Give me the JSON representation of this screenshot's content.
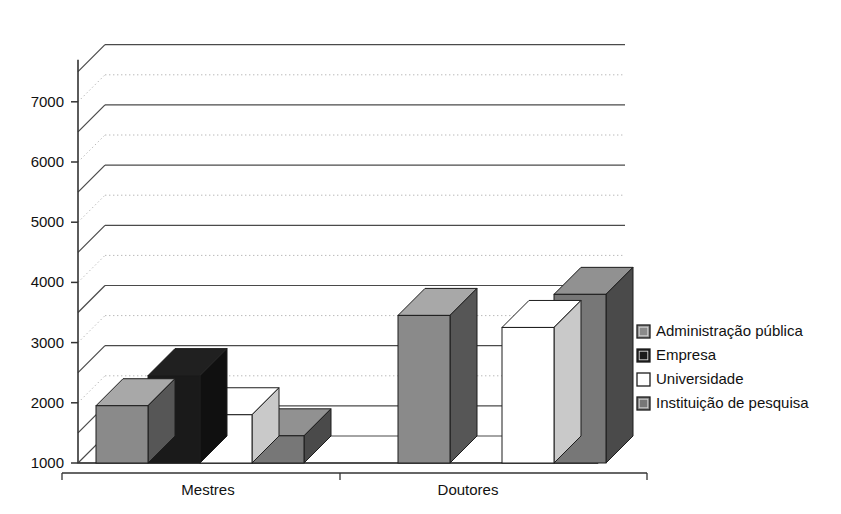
{
  "chart_data": {
    "type": "bar",
    "title": "",
    "subtitle": "",
    "xlabel": "",
    "ylabel": "",
    "categories": [
      "Mestres",
      "Doutores"
    ],
    "series": [
      {
        "name": "Administração pública",
        "color": "#8a8a8a",
        "values": [
          2400,
          3900
        ]
      },
      {
        "name": "Empresa",
        "color": "#1a1a1a",
        "values": [
          2900,
          null
        ]
      },
      {
        "name": "Universidade",
        "color": "#ffffff",
        "values": [
          2250,
          3700
        ]
      },
      {
        "name": "Instituição de pesquisa",
        "color": "#777777",
        "values": [
          1900,
          4250
        ]
      }
    ],
    "ylim": [
      1000,
      7500
    ],
    "ytick_labels": [
      "1000",
      "2000",
      "3000",
      "4000",
      "5000",
      "6000",
      "7000"
    ],
    "ytick_values": [
      1000,
      2000,
      3000,
      4000,
      5000,
      6000,
      7000
    ],
    "solid_gridline_values": [
      1500,
      2500,
      3500,
      4500,
      5500,
      6500,
      7500
    ],
    "dotted_gridline_values": [
      2000,
      3000,
      4000,
      5000,
      6000,
      7000
    ],
    "grid": true,
    "legend_position": "right",
    "three_d": true,
    "annotations": []
  },
  "axis": {
    "y_ticks": [
      {
        "label": "7000",
        "value": 7000
      },
      {
        "label": "6000",
        "value": 6000
      },
      {
        "label": "5000",
        "value": 5000
      },
      {
        "label": "4000",
        "value": 4000
      },
      {
        "label": "3000",
        "value": 3000
      },
      {
        "label": "2000",
        "value": 2000
      },
      {
        "label": "1000",
        "value": 1000
      }
    ],
    "x_categories": [
      {
        "label": "Mestres"
      },
      {
        "label": "Doutores"
      }
    ]
  },
  "legend": {
    "items": [
      {
        "label": "Administração pública",
        "swatch": "#8a8a8a"
      },
      {
        "label": "Empresa",
        "swatch": "#1a1a1a"
      },
      {
        "label": "Universidade",
        "swatch": "#ffffff"
      },
      {
        "label": "Instituição de pesquisa",
        "swatch": "#777777"
      }
    ]
  }
}
